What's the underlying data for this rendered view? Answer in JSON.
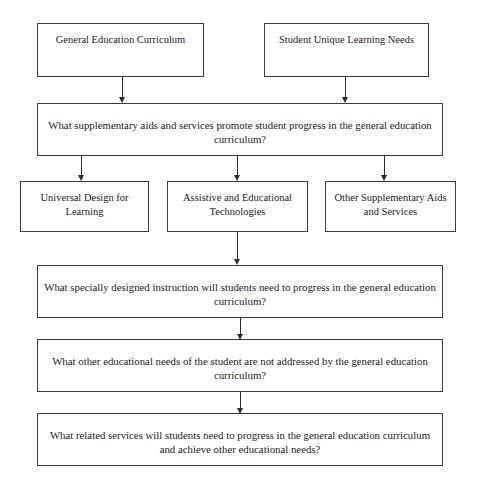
{
  "diagram": {
    "background_color": "#ffffff",
    "border_color": "#3b3b3b",
    "line_color": "#2b2b2b",
    "text_color": "#1a1a1a"
  },
  "nodes": {
    "source_curriculum": "General Education Curriculum",
    "source_needs": "Student Unique Learning Needs",
    "question_supplementary": "What supplementary aids and services promote student progress in the general education curriculum?",
    "option_udl": "Universal Design for Learning",
    "option_technologies": "Assistive and Educational Technologies",
    "option_other_aids": "Other Supplementary Aids and Services",
    "question_instruction": "What specially designed instruction will students need to progress in the general education curriculum?",
    "question_other_needs": "What other educational needs of the student are not addressed by the general education curriculum?",
    "question_related_services": "What related services will students need to progress in the general education curriculum and achieve other educational needs?"
  }
}
